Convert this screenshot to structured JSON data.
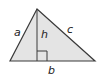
{
  "diagram": {
    "type": "triangle-with-altitude",
    "fill_color": "#e4e4e4",
    "stroke_color": "#3a3a3a",
    "labels": {
      "side_left": "a",
      "altitude": "h",
      "side_right": "c",
      "base": "b"
    },
    "vertices": {
      "apex": [
        37,
        9
      ],
      "bottom_left": [
        10,
        61
      ],
      "bottom_right": [
        95,
        61
      ]
    },
    "right_angle_marker": true
  }
}
